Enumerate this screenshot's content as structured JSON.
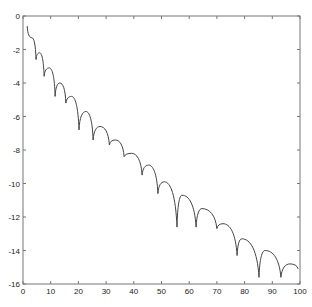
{
  "chart_data": {
    "type": "line",
    "title": "",
    "xlabel": "",
    "ylabel": "",
    "xlim": [
      0,
      100
    ],
    "ylim": [
      -16,
      0
    ],
    "grid": false,
    "legend": null,
    "x_ticks": [
      0,
      10,
      20,
      30,
      40,
      50,
      60,
      70,
      80,
      90,
      100
    ],
    "y_ticks": [
      0,
      -2,
      -4,
      -6,
      -8,
      -10,
      -12,
      -14,
      -16
    ],
    "x_tick_labels": [
      "0",
      "10",
      "20",
      "30",
      "40",
      "50",
      "60",
      "70",
      "80",
      "90",
      "100"
    ],
    "y_tick_labels": [
      "0",
      "-2",
      "-4",
      "-6",
      "-8",
      "-10",
      "-12",
      "-14",
      "-16"
    ],
    "series": [
      {
        "name": "series-1",
        "color": "#444444",
        "points": [
          {
            "x": 1.5,
            "y": -0.6,
            "kind": "start"
          },
          {
            "x": 3.2,
            "y": -1.3,
            "kind": "peak"
          },
          {
            "x": 4.7,
            "y": -2.6,
            "kind": "dip"
          },
          {
            "x": 6.0,
            "y": -2.2,
            "kind": "peak"
          },
          {
            "x": 7.6,
            "y": -3.6,
            "kind": "dip"
          },
          {
            "x": 9.5,
            "y": -3.1,
            "kind": "peak"
          },
          {
            "x": 11.6,
            "y": -4.8,
            "kind": "dip"
          },
          {
            "x": 13.3,
            "y": -4.0,
            "kind": "peak"
          },
          {
            "x": 15.5,
            "y": -5.2,
            "kind": "dip"
          },
          {
            "x": 17.5,
            "y": -4.8,
            "kind": "peak"
          },
          {
            "x": 20.2,
            "y": -6.8,
            "kind": "dip"
          },
          {
            "x": 22.7,
            "y": -5.7,
            "kind": "peak"
          },
          {
            "x": 25.3,
            "y": -7.4,
            "kind": "dip"
          },
          {
            "x": 27.8,
            "y": -6.6,
            "kind": "peak"
          },
          {
            "x": 31.2,
            "y": -7.7,
            "kind": "dip"
          },
          {
            "x": 33.3,
            "y": -7.4,
            "kind": "peak"
          },
          {
            "x": 36.5,
            "y": -8.4,
            "kind": "dip"
          },
          {
            "x": 39.2,
            "y": -8.2,
            "kind": "peak"
          },
          {
            "x": 43.0,
            "y": -9.5,
            "kind": "dip"
          },
          {
            "x": 45.3,
            "y": -8.9,
            "kind": "peak"
          },
          {
            "x": 48.7,
            "y": -10.6,
            "kind": "dip"
          },
          {
            "x": 51.0,
            "y": -9.9,
            "kind": "peak"
          },
          {
            "x": 55.6,
            "y": -12.6,
            "kind": "dip"
          },
          {
            "x": 57.4,
            "y": -10.7,
            "kind": "peak"
          },
          {
            "x": 62.5,
            "y": -12.6,
            "kind": "dip"
          },
          {
            "x": 64.6,
            "y": -11.5,
            "kind": "peak"
          },
          {
            "x": 70.0,
            "y": -12.7,
            "kind": "dip"
          },
          {
            "x": 72.2,
            "y": -12.4,
            "kind": "peak"
          },
          {
            "x": 77.3,
            "y": -14.3,
            "kind": "dip"
          },
          {
            "x": 79.0,
            "y": -13.3,
            "kind": "peak"
          },
          {
            "x": 85.2,
            "y": -15.6,
            "kind": "dip"
          },
          {
            "x": 87.4,
            "y": -14.0,
            "kind": "peak"
          },
          {
            "x": 93.1,
            "y": -15.6,
            "kind": "dip"
          },
          {
            "x": 96.4,
            "y": -14.8,
            "kind": "peak"
          },
          {
            "x": 99.3,
            "y": -15.1,
            "kind": "end"
          }
        ]
      }
    ]
  },
  "plot": {
    "left": 23,
    "top": 16,
    "right": 300,
    "bottom": 284
  }
}
